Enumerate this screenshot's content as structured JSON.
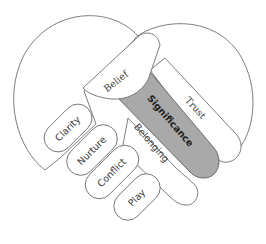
{
  "diagram": {
    "type": "clasped-hands-heart",
    "colors": {
      "outline": "#6f6f6f",
      "fill": "#ffffff",
      "highlight": "#a9a9a9"
    },
    "upper_hand": {
      "labels": {
        "thumb": "Belief",
        "band_outer": "Trust",
        "band_highlight": "Significance",
        "band_inner": "Belonging"
      }
    },
    "lower_hand": {
      "fingers": [
        {
          "label": "Clarity"
        },
        {
          "label": "Nurture"
        },
        {
          "label": "Conflict"
        },
        {
          "label": "Play"
        }
      ]
    }
  }
}
